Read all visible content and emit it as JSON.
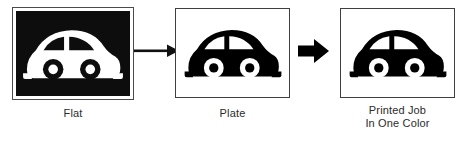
{
  "diagram": {
    "background_color": "#ffffff",
    "ink_color": "#000000",
    "rule_color": "#3f3f3f",
    "steps": [
      {
        "id": "flat",
        "caption": "Flat",
        "icon": "car-icon",
        "art_style": "reverse (white artwork on solid black field)",
        "panel_fill": "#0d0d0d",
        "artwork_color": "#ffffff"
      },
      {
        "id": "plate",
        "caption": "Plate",
        "icon": "car-icon",
        "art_style": "positive (black artwork on white field)",
        "panel_fill": "#ffffff",
        "artwork_color": "#000000"
      },
      {
        "id": "printed-job",
        "caption": "Printed Job\nIn One Color",
        "caption_line_1": "Printed Job",
        "caption_line_2": "In One Color",
        "icon": "car-icon",
        "art_style": "positive (black artwork on white field)",
        "panel_fill": "#ffffff",
        "artwork_color": "#000000"
      }
    ],
    "arrows": [
      {
        "id": "arrow-flat-to-plate",
        "style": "thin-line-with-solid-head",
        "direction": "right"
      },
      {
        "id": "arrow-plate-to-printed",
        "style": "solid-block-arrow",
        "direction": "right"
      }
    ]
  }
}
